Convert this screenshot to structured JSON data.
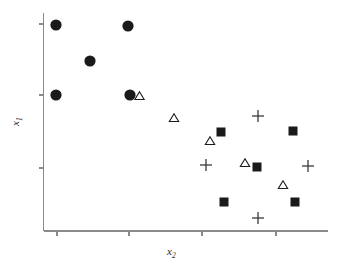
{
  "chart_data": {
    "type": "scatter",
    "title": "",
    "xlabel": "x2",
    "ylabel": "x1",
    "xlabel_base": "x",
    "xlabel_sub": "2",
    "ylabel_base": "x",
    "ylabel_sub": "1",
    "grid": false,
    "legend": "none",
    "xlim": [
      0,
      100
    ],
    "ylim": [
      0,
      100
    ],
    "x_ticks": [
      10,
      45,
      81,
      117
    ],
    "y_ticks": [
      22,
      55,
      91
    ],
    "x_tick_labels": [
      "",
      "",
      "",
      ""
    ],
    "y_tick_labels": [
      "",
      "",
      ""
    ],
    "axis_color": "#8a8a8a",
    "marker_color": "#1a1a1a",
    "series": [
      {
        "name": "circle-group",
        "marker": "filled-circle",
        "points": [
          {
            "x": 6.4,
            "y": 96.8
          },
          {
            "x": 31.1,
            "y": 95.2
          },
          {
            "x": 18.1,
            "y": 79.4
          },
          {
            "x": 6.4,
            "y": 62.5
          },
          {
            "x": 31.9,
            "y": 62.5
          }
        ]
      },
      {
        "name": "triangle-group",
        "marker": "open-triangle",
        "points": [
          {
            "x": 35.1,
            "y": 61.9
          },
          {
            "x": 47.1,
            "y": 51.9
          },
          {
            "x": 60.6,
            "y": 41.3
          },
          {
            "x": 73.1,
            "y": 31.0
          },
          {
            "x": 86.6,
            "y": 20.7
          }
        ]
      },
      {
        "name": "square-group",
        "marker": "filled-square",
        "points": [
          {
            "x": 64.8,
            "y": 44.3
          },
          {
            "x": 77.7,
            "y": 30.5
          },
          {
            "x": 90.6,
            "y": 44.8
          },
          {
            "x": 65.9,
            "y": 13.4
          },
          {
            "x": 91.8,
            "y": 13.4
          }
        ]
      },
      {
        "name": "plus-group",
        "marker": "plus",
        "points": [
          {
            "x": 58.5,
            "y": 31.5
          },
          {
            "x": 77.0,
            "y": 55.5
          },
          {
            "x": 94.5,
            "y": 30.8
          },
          {
            "x": 77.0,
            "y": 5.3
          }
        ]
      }
    ],
    "pixel_markers": [
      {
        "type": "circle",
        "cx": 56,
        "cy": 25,
        "r": 5.6
      },
      {
        "type": "circle",
        "cx": 128,
        "cy": 26,
        "r": 5.6
      },
      {
        "type": "circle",
        "cx": 90,
        "cy": 61,
        "r": 5.6
      },
      {
        "type": "circle",
        "cx": 56,
        "cy": 95,
        "r": 5.6
      },
      {
        "type": "circle",
        "cx": 130,
        "cy": 95,
        "r": 5.6
      },
      {
        "type": "triangle",
        "cx": 139.5,
        "cy": 96,
        "s": 7.5
      },
      {
        "type": "triangle",
        "cx": 174,
        "cy": 118,
        "s": 7.5
      },
      {
        "type": "triangle",
        "cx": 210,
        "cy": 141,
        "s": 7.5
      },
      {
        "type": "triangle",
        "cx": 245,
        "cy": 163,
        "s": 7.5
      },
      {
        "type": "triangle",
        "cx": 283,
        "cy": 185,
        "s": 7.5
      },
      {
        "type": "square",
        "cx": 221,
        "cy": 132,
        "s": 9
      },
      {
        "type": "square",
        "cx": 257,
        "cy": 167,
        "s": 9
      },
      {
        "type": "square",
        "cx": 293,
        "cy": 131,
        "s": 9
      },
      {
        "type": "square",
        "cx": 224,
        "cy": 202,
        "s": 9
      },
      {
        "type": "square",
        "cx": 295,
        "cy": 202,
        "s": 9
      },
      {
        "type": "plus",
        "cx": 206,
        "cy": 165,
        "s": 6
      },
      {
        "type": "plus",
        "cx": 258,
        "cy": 116,
        "s": 6
      },
      {
        "type": "plus",
        "cx": 308,
        "cy": 166,
        "s": 6
      },
      {
        "type": "plus",
        "cx": 258,
        "cy": 218,
        "s": 6
      }
    ]
  },
  "axes": {
    "x_axis_y": 231,
    "y_axis_x": 43.5,
    "y_axis_top": 13,
    "x_axis_right": 328,
    "x_tick_px": [
      57,
      129,
      202,
      276
    ],
    "y_tick_px": [
      24,
      95,
      168
    ],
    "tick_len": 5
  }
}
